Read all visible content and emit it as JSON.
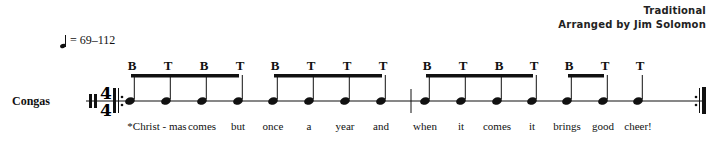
{
  "credits": {
    "title": "Traditional",
    "arranger": "Arranged by Jim Solomon"
  },
  "tempo": {
    "icon": "quarter-note-icon",
    "text": "= 69–112"
  },
  "instrument": "Congas",
  "time_signature": {
    "top": "4",
    "bottom": "4"
  },
  "sticking": [
    "B",
    "T",
    "B",
    "T",
    "B",
    "T",
    "T",
    "T",
    "B",
    "T",
    "B",
    "T",
    "B",
    "T",
    "T"
  ],
  "lyrics": [
    "*Christ - mas",
    "comes",
    "but",
    "once",
    "a",
    "year",
    "and",
    "when",
    "it",
    "comes",
    "it",
    "brings",
    "good",
    "cheer!"
  ],
  "notes_x": [
    130,
    166,
    202,
    238,
    273,
    309,
    345,
    381,
    425,
    461,
    497,
    532,
    567,
    603,
    638
  ],
  "lyrics_x": [
    157,
    202,
    238,
    273,
    309,
    345,
    381,
    425,
    461,
    497,
    532,
    567,
    603,
    638
  ]
}
